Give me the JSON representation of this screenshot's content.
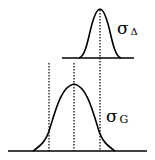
{
  "diagram": {
    "top_distribution": {
      "label_symbol": "σ",
      "label_subscript": "Δ",
      "center_x": 100,
      "baseline_y": 58
    },
    "bottom_distribution": {
      "label_symbol": "σ",
      "label_subscript": "G",
      "center_x": 74,
      "baseline_y": 151
    },
    "dotted_markers_x": [
      49,
      74,
      100
    ],
    "colors": {
      "line": "#000000",
      "background": "#ffffff"
    }
  }
}
